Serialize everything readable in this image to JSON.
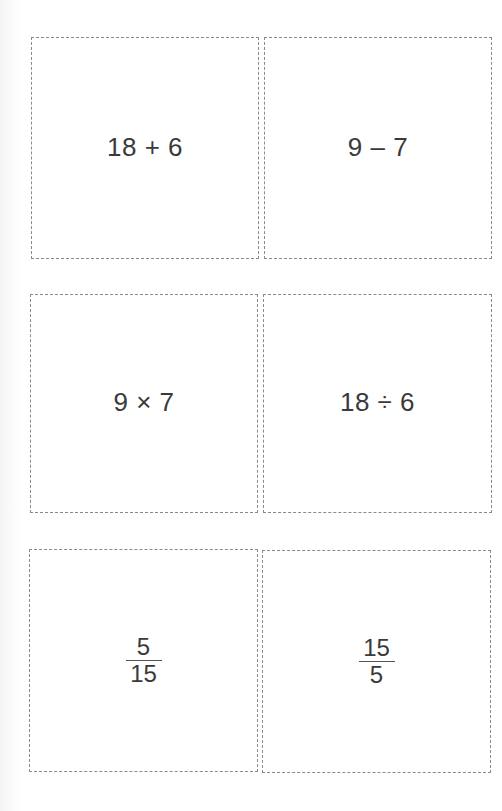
{
  "cards": [
    {
      "type": "expression",
      "text": "18 + 6"
    },
    {
      "type": "expression",
      "text": "9 – 7"
    },
    {
      "type": "expression",
      "text": "9 × 7"
    },
    {
      "type": "expression",
      "text": "18 ÷ 6"
    },
    {
      "type": "fraction",
      "numerator": "5",
      "denominator": "15"
    },
    {
      "type": "fraction",
      "numerator": "15",
      "denominator": "5"
    }
  ],
  "colors": {
    "border": "#8a8a8a",
    "text": "#3a3a3a",
    "background": "#ffffff"
  }
}
